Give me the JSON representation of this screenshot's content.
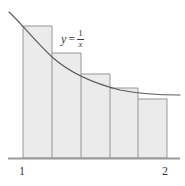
{
  "figure": {
    "curve_label": {
      "variable": "y",
      "equals": "=",
      "numerator": "1",
      "denominator": "x",
      "full_text": "y = 1/x"
    },
    "axis": {
      "tick_labels": [
        "1",
        "2"
      ]
    },
    "colors": {
      "fill": "#ebebeb",
      "stroke": "#8c8c8c",
      "curve": "#5a5a5a",
      "axis": "#9a9a9a",
      "text": "#3a3a3a",
      "background": "#ffffff"
    }
  },
  "chart_data": {
    "type": "area",
    "title": "",
    "subtitle": "",
    "xlabel": "",
    "ylabel": "",
    "function": "y = 1/x",
    "xlim": [
      0.75,
      2.2
    ],
    "ylim": [
      0,
      1.45
    ],
    "grid": false,
    "legend": null,
    "annotations": [
      {
        "text": "y = 1/x",
        "x": 1.42,
        "y": 1.02
      }
    ],
    "xticks": [
      1,
      2
    ],
    "xticklabels": [
      "1",
      "2"
    ],
    "yticks": [],
    "yticklabels": [],
    "curve": {
      "name": "y = 1/x",
      "x": [
        0.79,
        0.85,
        0.9,
        1.0,
        1.1,
        1.2,
        1.3,
        1.4,
        1.5,
        1.6,
        1.7,
        1.8,
        1.9,
        2.0,
        2.1,
        2.17
      ],
      "y": [
        1.266,
        1.176,
        1.111,
        1.0,
        0.909,
        0.833,
        0.769,
        0.714,
        0.667,
        0.625,
        0.588,
        0.556,
        0.526,
        0.5,
        0.476,
        0.461
      ]
    },
    "rectangles": {
      "count": 5,
      "rule": "left-endpoint",
      "x_left": [
        1.0,
        1.2,
        1.4,
        1.6,
        1.8
      ],
      "x_right": [
        1.2,
        1.4,
        1.6,
        1.8,
        2.0
      ],
      "width": 0.2,
      "heights": [
        1.0,
        0.8333,
        0.7143,
        0.625,
        0.5556
      ]
    }
  },
  "geometry": {
    "note": "pixel coordinates used by the template rendering",
    "baseline_y": 158,
    "axis_x_start": 8,
    "axis_x_end": 180,
    "region_x_start": 23,
    "region_x_end": 167,
    "dividers_x": [
      23,
      52,
      81,
      110,
      138,
      167
    ],
    "rect_tops_y": [
      26,
      53,
      74,
      88,
      99
    ],
    "curve_path": "M 9,12 C 20,22 34,40 52,57 C 70,73 92,83 120,90 C 145,95 165,95 180,95",
    "shaded_path": "M 23,26 L 52,26 L 52,53 L 81,53 L 81,74 L 110,74 L 110,88 L 138,88 L 138,99 L 167,99 L 167,158 L 23,158 Z"
  }
}
